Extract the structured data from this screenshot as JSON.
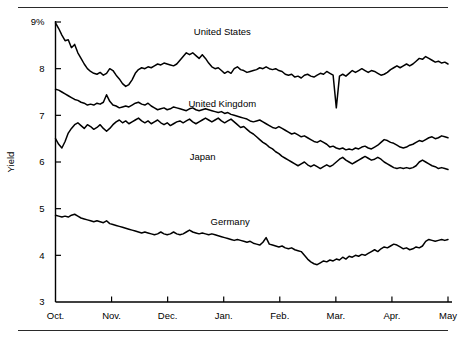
{
  "chart_data": {
    "type": "line",
    "title": "",
    "subtitle": "",
    "xlabel": "",
    "ylabel": "Yield",
    "ylim": [
      3,
      9
    ],
    "yticks": [
      3,
      4,
      5,
      6,
      7,
      8,
      9
    ],
    "ytick_labels": [
      "3",
      "4",
      "5",
      "6",
      "7",
      "8",
      "9%"
    ],
    "xticks": [
      "Oct.",
      "Nov.",
      "Dec.",
      "Jan.",
      "Feb.",
      "Mar.",
      "Apr.",
      "May"
    ],
    "xtick_labels": [
      "Oct.",
      "Nov.",
      "Dec.",
      "Jan.",
      "Feb.",
      "Mar.",
      "Apr.",
      "May"
    ],
    "grid": false,
    "legend_position": "inline-annotation",
    "line_color": "#000000",
    "series": [
      {
        "name": "United States",
        "label_x_frac": 0.425,
        "label_y_value": 8.72,
        "values": [
          8.98,
          8.86,
          8.72,
          8.6,
          8.62,
          8.45,
          8.52,
          8.34,
          8.22,
          8.1,
          8.0,
          7.94,
          7.9,
          7.88,
          7.92,
          7.86,
          7.9,
          8.0,
          7.96,
          7.86,
          7.78,
          7.68,
          7.62,
          7.66,
          7.76,
          7.9,
          7.98,
          8.02,
          8.0,
          8.04,
          8.02,
          8.06,
          8.1,
          8.08,
          8.12,
          8.1,
          8.08,
          8.06,
          8.1,
          8.18,
          8.26,
          8.34,
          8.3,
          8.34,
          8.28,
          8.22,
          8.3,
          8.22,
          8.12,
          8.04,
          8.0,
          8.02,
          7.96,
          7.9,
          7.94,
          7.9,
          8.0,
          8.04,
          7.98,
          7.96,
          7.92,
          7.94,
          7.96,
          7.98,
          8.02,
          8.0,
          8.04,
          8.0,
          7.98,
          8.0,
          7.96,
          7.94,
          7.88,
          7.86,
          7.88,
          7.82,
          7.84,
          7.8,
          7.86,
          7.88,
          7.84,
          7.82,
          7.86,
          7.9,
          7.88,
          7.94,
          7.9,
          7.86,
          7.16,
          7.84,
          7.88,
          7.84,
          7.9,
          7.96,
          7.92,
          7.96,
          8.0,
          7.96,
          7.92,
          7.96,
          7.94,
          7.9,
          7.86,
          7.88,
          7.92,
          7.98,
          8.02,
          8.06,
          8.02,
          8.06,
          8.1,
          8.06,
          8.1,
          8.16,
          8.22,
          8.2,
          8.26,
          8.22,
          8.18,
          8.14,
          8.16,
          8.12,
          8.14,
          8.1
        ]
      },
      {
        "name": "United Kingdom",
        "label_x_frac": 0.425,
        "label_y_value": 7.18,
        "values": [
          7.56,
          7.54,
          7.5,
          7.46,
          7.42,
          7.38,
          7.34,
          7.32,
          7.28,
          7.26,
          7.22,
          7.24,
          7.22,
          7.26,
          7.24,
          7.28,
          7.44,
          7.3,
          7.22,
          7.2,
          7.16,
          7.18,
          7.2,
          7.18,
          7.22,
          7.26,
          7.28,
          7.24,
          7.22,
          7.26,
          7.2,
          7.16,
          7.12,
          7.14,
          7.16,
          7.12,
          7.14,
          7.18,
          7.16,
          7.14,
          7.12,
          7.1,
          7.14,
          7.16,
          7.12,
          7.1,
          7.12,
          7.14,
          7.12,
          7.1,
          7.08,
          7.06,
          7.08,
          7.04,
          7.06,
          7.02,
          7.0,
          6.98,
          6.96,
          6.94,
          6.92,
          6.88,
          6.86,
          6.88,
          6.9,
          6.86,
          6.82,
          6.78,
          6.74,
          6.72,
          6.76,
          6.72,
          6.68,
          6.64,
          6.6,
          6.62,
          6.58,
          6.54,
          6.56,
          6.52,
          6.48,
          6.44,
          6.42,
          6.46,
          6.42,
          6.38,
          6.32,
          6.34,
          6.3,
          6.28,
          6.3,
          6.26,
          6.28,
          6.26,
          6.3,
          6.28,
          6.32,
          6.34,
          6.3,
          6.28,
          6.32,
          6.36,
          6.42,
          6.48,
          6.46,
          6.42,
          6.4,
          6.36,
          6.32,
          6.3,
          6.32,
          6.36,
          6.38,
          6.42,
          6.46,
          6.44,
          6.48,
          6.52,
          6.54,
          6.5,
          6.52,
          6.56,
          6.54,
          6.52
        ]
      },
      {
        "name": "Japan",
        "label_x_frac": 0.375,
        "label_y_value": 6.05,
        "values": [
          6.5,
          6.38,
          6.3,
          6.44,
          6.62,
          6.72,
          6.8,
          6.84,
          6.78,
          6.72,
          6.8,
          6.76,
          6.7,
          6.74,
          6.8,
          6.72,
          6.66,
          6.72,
          6.8,
          6.86,
          6.9,
          6.84,
          6.88,
          6.82,
          6.86,
          6.9,
          6.94,
          6.88,
          6.84,
          6.88,
          6.82,
          6.86,
          6.9,
          6.84,
          6.8,
          6.84,
          6.78,
          6.82,
          6.86,
          6.88,
          6.84,
          6.88,
          6.92,
          6.86,
          6.82,
          6.86,
          6.9,
          6.94,
          6.9,
          6.86,
          6.9,
          6.94,
          6.88,
          6.84,
          6.88,
          6.92,
          6.86,
          6.8,
          6.74,
          6.76,
          6.7,
          6.64,
          6.6,
          6.54,
          6.48,
          6.42,
          6.38,
          6.32,
          6.28,
          6.22,
          6.18,
          6.12,
          6.08,
          6.04,
          6.0,
          5.96,
          5.92,
          5.96,
          6.0,
          5.94,
          5.9,
          5.94,
          5.9,
          5.86,
          5.9,
          5.94,
          5.9,
          5.94,
          6.0,
          6.06,
          6.1,
          6.04,
          6.0,
          5.96,
          6.0,
          6.04,
          6.08,
          6.12,
          6.08,
          6.04,
          6.06,
          6.1,
          6.06,
          6.0,
          5.96,
          5.92,
          5.88,
          5.86,
          5.88,
          5.86,
          5.88,
          5.86,
          5.88,
          5.92,
          6.0,
          6.04,
          6.0,
          5.96,
          5.92,
          5.9,
          5.86,
          5.88,
          5.86,
          5.84
        ]
      },
      {
        "name": "Germany",
        "label_x_frac": 0.445,
        "label_y_value": 4.66,
        "values": [
          4.86,
          4.84,
          4.82,
          4.84,
          4.82,
          4.86,
          4.88,
          4.84,
          4.8,
          4.78,
          4.76,
          4.74,
          4.72,
          4.74,
          4.72,
          4.7,
          4.74,
          4.68,
          4.66,
          4.64,
          4.62,
          4.6,
          4.58,
          4.56,
          4.54,
          4.52,
          4.5,
          4.48,
          4.5,
          4.48,
          4.46,
          4.44,
          4.46,
          4.5,
          4.46,
          4.44,
          4.46,
          4.5,
          4.46,
          4.44,
          4.46,
          4.5,
          4.54,
          4.5,
          4.48,
          4.46,
          4.48,
          4.46,
          4.44,
          4.46,
          4.44,
          4.42,
          4.4,
          4.38,
          4.36,
          4.34,
          4.32,
          4.34,
          4.32,
          4.3,
          4.28,
          4.3,
          4.26,
          4.24,
          4.22,
          4.28,
          4.38,
          4.24,
          4.22,
          4.2,
          4.18,
          4.2,
          4.16,
          4.14,
          4.16,
          4.12,
          4.1,
          4.08,
          4.0,
          3.92,
          3.86,
          3.82,
          3.8,
          3.84,
          3.88,
          3.86,
          3.9,
          3.88,
          3.92,
          3.9,
          3.96,
          3.92,
          3.98,
          3.96,
          4.0,
          3.98,
          4.02,
          4.0,
          4.04,
          4.08,
          4.12,
          4.08,
          4.14,
          4.18,
          4.16,
          4.2,
          4.24,
          4.22,
          4.18,
          4.14,
          4.16,
          4.12,
          4.14,
          4.18,
          4.16,
          4.2,
          4.3,
          4.34,
          4.32,
          4.3,
          4.32,
          4.34,
          4.32,
          4.34
        ]
      }
    ]
  },
  "axes": {
    "y_title": "Yield"
  }
}
